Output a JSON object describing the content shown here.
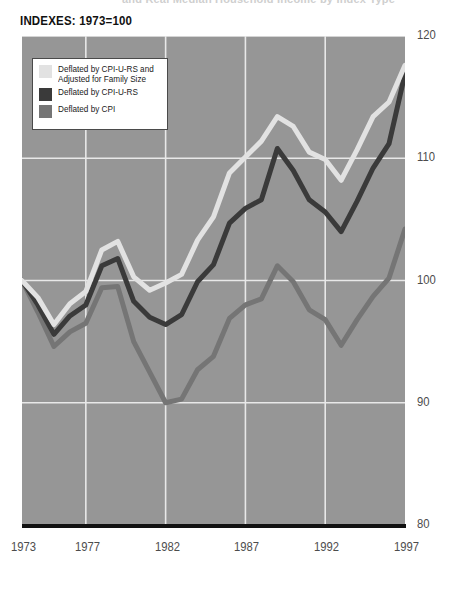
{
  "page": {
    "clipped_top_text": "and Real Median Household Income by Index Type",
    "axis_title": "INDEXES: 1973=100",
    "background_color": "#ffffff",
    "plot_background_color": "#969696",
    "gridline_color": "#e8e8e8",
    "baseline_color": "#111111"
  },
  "legend": {
    "items": [
      {
        "label": "Deflated by CPI-U-RS and\nAdjusted for Family Size",
        "color": "#e2e2e2"
      },
      {
        "label": "Deflated by CPI-U-RS",
        "color": "#3a3a3a"
      },
      {
        "label": "Deflated by CPI",
        "color": "#757575"
      }
    ]
  },
  "axes": {
    "y_ticks": [
      "120",
      "110",
      "100",
      "90",
      "80"
    ],
    "y_values": [
      120,
      110,
      100,
      90,
      80
    ],
    "x_ticks": [
      "1973",
      "1977",
      "1982",
      "1987",
      "1992",
      "1997"
    ],
    "x_tick_years": [
      1973,
      1977,
      1982,
      1987,
      1992,
      1997
    ]
  },
  "chart_data": {
    "type": "line",
    "title": "INDEXES: 1973=100",
    "xlabel": "",
    "ylabel": "",
    "xlim": [
      1973,
      1997
    ],
    "ylim": [
      80,
      120
    ],
    "grid": true,
    "legend_position": "top-left",
    "x": [
      1973,
      1974,
      1975,
      1976,
      1977,
      1978,
      1979,
      1980,
      1981,
      1982,
      1983,
      1984,
      1985,
      1986,
      1987,
      1988,
      1989,
      1990,
      1991,
      1992,
      1993,
      1994,
      1995,
      1996,
      1997
    ],
    "series": [
      {
        "name": "Deflated by CPI-U-RS and Adjusted for Family Size",
        "color": "#e2e2e2",
        "values": [
          100.0,
          98.6,
          96.4,
          98.1,
          99.1,
          102.5,
          103.2,
          100.3,
          99.2,
          99.8,
          100.5,
          103.3,
          105.2,
          108.8,
          110.1,
          111.4,
          113.4,
          112.6,
          110.5,
          109.9,
          108.2,
          110.7,
          113.4,
          114.6,
          117.6
        ]
      },
      {
        "name": "Deflated by CPI-U-RS",
        "color": "#3a3a3a",
        "values": [
          100.0,
          98.0,
          95.6,
          97.1,
          98.0,
          101.2,
          101.8,
          98.3,
          97.0,
          96.4,
          97.2,
          99.9,
          101.3,
          104.7,
          105.9,
          106.6,
          110.8,
          109.0,
          106.6,
          105.6,
          104.0,
          106.5,
          109.2,
          111.2,
          116.9
        ]
      },
      {
        "name": "Deflated by CPI",
        "color": "#757575",
        "values": [
          100.0,
          97.4,
          94.6,
          95.8,
          96.5,
          99.4,
          99.5,
          95.0,
          92.5,
          90.0,
          90.3,
          92.7,
          93.8,
          96.9,
          98.0,
          98.5,
          101.2,
          99.9,
          97.6,
          96.8,
          94.7,
          96.8,
          98.7,
          100.2,
          104.2
        ]
      }
    ]
  }
}
